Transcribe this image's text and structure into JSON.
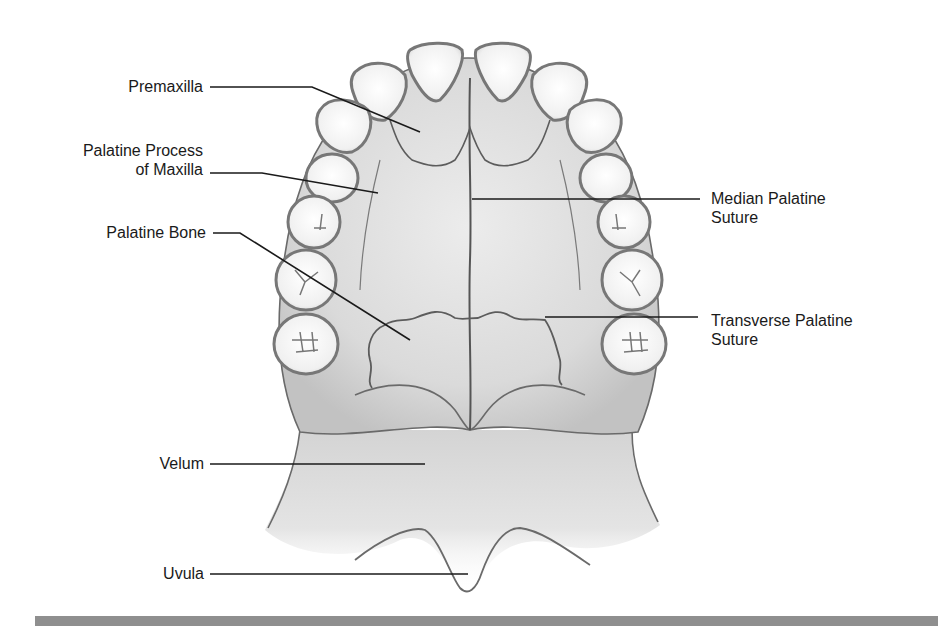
{
  "figure": {
    "colors": {
      "background": "#ffffff",
      "tissue_fill": "#e2e2e2",
      "tissue_shade": "#c4c4c4",
      "outline": "#6a6a6a",
      "tooth_fill": "#f4f4f4",
      "leader_line": "#1a1a1a",
      "bottom_bar": "#8f8f8f",
      "label_text": "#1a1a1a"
    }
  },
  "labels": {
    "premaxilla": "Premaxilla",
    "palatine_process_line1": "Palatine Process",
    "palatine_process_line2": "of Maxilla",
    "palatine_bone": "Palatine Bone",
    "median_suture_line1": "Median Palatine",
    "median_suture_line2": "Suture",
    "transverse_suture_line1": "Transverse Palatine",
    "transverse_suture_line2": "Suture",
    "velum": "Velum",
    "uvula": "Uvula"
  }
}
